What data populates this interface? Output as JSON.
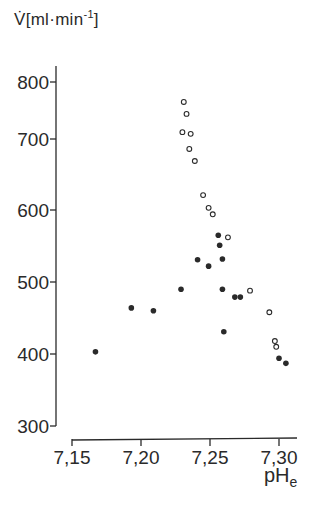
{
  "chart_data": {
    "type": "scatter",
    "title": "",
    "ylabel": "V̇[ml·min⁻¹]",
    "ylabel_parts": {
      "symbol": "V̇",
      "unit_open": "[ml·min",
      "exp": "-1",
      "unit_close": "]"
    },
    "xlabel": "pHe",
    "xlabel_parts": {
      "base": "pH",
      "sub": "e"
    },
    "xlim": [
      7.15,
      7.31
    ],
    "ylim": [
      300,
      800
    ],
    "x_ticks": [
      "7,15",
      "7,20",
      "7,25",
      "7,30"
    ],
    "x_tick_values": [
      7.15,
      7.2,
      7.25,
      7.3
    ],
    "y_ticks": [
      "800",
      "700",
      "600",
      "500",
      "400",
      "300"
    ],
    "y_tick_values": [
      800,
      700,
      600,
      500,
      400,
      300
    ],
    "grid": false,
    "legend": null,
    "series": [
      {
        "name": "open circles",
        "marker": "open-circle",
        "points": [
          [
            7.231,
            765
          ],
          [
            7.233,
            744
          ],
          [
            7.23,
            712
          ],
          [
            7.236,
            709
          ],
          [
            7.235,
            686
          ],
          [
            7.239,
            669
          ],
          [
            7.245,
            621
          ],
          [
            7.249,
            603
          ],
          [
            7.252,
            594
          ],
          [
            7.263,
            562
          ],
          [
            7.279,
            488
          ],
          [
            7.293,
            458
          ],
          [
            7.297,
            418
          ],
          [
            7.298,
            410
          ]
        ]
      },
      {
        "name": "filled circles",
        "marker": "filled-circle",
        "points": [
          [
            7.167,
            403
          ],
          [
            7.193,
            464
          ],
          [
            7.209,
            460
          ],
          [
            7.229,
            490
          ],
          [
            7.241,
            531
          ],
          [
            7.249,
            522
          ],
          [
            7.256,
            565
          ],
          [
            7.257,
            551
          ],
          [
            7.259,
            532
          ],
          [
            7.259,
            490
          ],
          [
            7.268,
            479
          ],
          [
            7.272,
            479
          ],
          [
            7.26,
            431
          ],
          [
            7.3,
            394
          ],
          [
            7.305,
            387
          ]
        ]
      }
    ]
  },
  "colors": {
    "ink": "#2a2a2a",
    "background": "#ffffff"
  }
}
